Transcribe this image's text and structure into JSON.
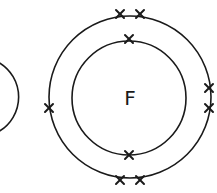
{
  "diagram": {
    "type": "electron-shell (dot-and-cross) diagram",
    "atom": {
      "symbol": "F",
      "shells": [
        {
          "name": "inner-shell",
          "electrons": 2
        },
        {
          "name": "outer-shell",
          "electrons": 7
        }
      ]
    },
    "partial_left_shell_visible": true,
    "colors": {
      "line": "#1a1a1a",
      "background": "#ffffff"
    }
  }
}
